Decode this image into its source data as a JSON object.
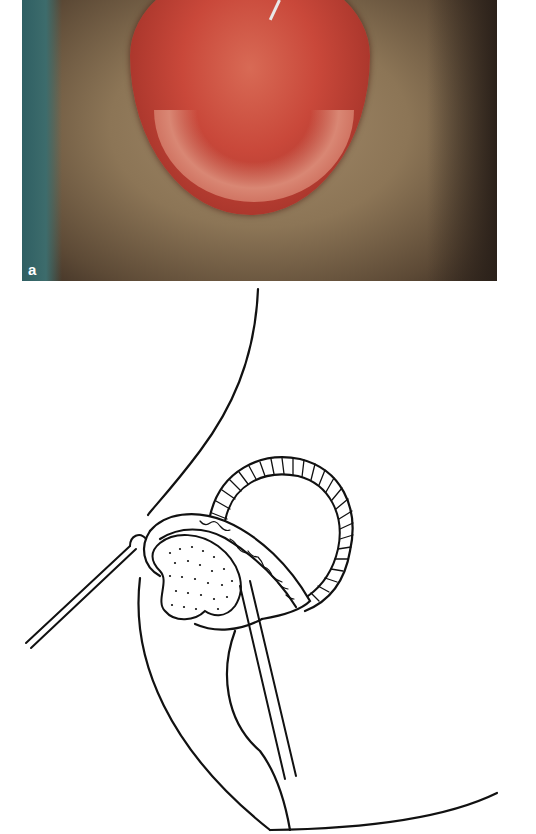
{
  "figure": {
    "panel_a": {
      "label": "a",
      "type": "clinical-photograph",
      "description": "Intraoperative photo of everted tissue with suture clip"
    },
    "panel_b": {
      "type": "line-drawing",
      "description": "Schematic of everted tissue loop with sutures and forceps"
    }
  }
}
